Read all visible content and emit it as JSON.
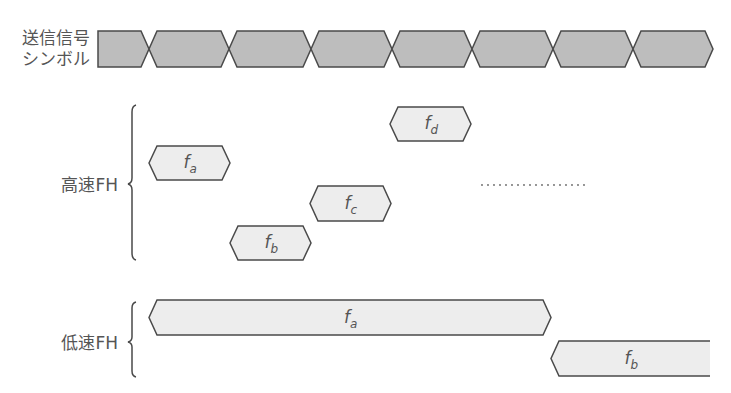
{
  "labels": {
    "tx_symbol_line1": "送信信号",
    "tx_symbol_line2": "シンボル",
    "fast_fh": "高速FH",
    "slow_fh": "低速FH"
  },
  "colors": {
    "symbol_fill": "#bdbdbd",
    "hop_fill": "#ededed",
    "stroke": "#4a4a4a",
    "text": "#555555"
  },
  "symbols": {
    "count": 8,
    "x_start": 98,
    "period": 81,
    "y_top": 31,
    "y_bottom": 67
  },
  "fast_fh_hops": [
    {
      "freq": "f",
      "sub": "a",
      "x1": 149,
      "x2": 230,
      "y1": 146,
      "y2": 180
    },
    {
      "freq": "f",
      "sub": "b",
      "x1": 230,
      "x2": 311,
      "y1": 226,
      "y2": 260
    },
    {
      "freq": "f",
      "sub": "c",
      "x1": 310,
      "x2": 391,
      "y1": 186,
      "y2": 221
    },
    {
      "freq": "f",
      "sub": "d",
      "x1": 390,
      "x2": 471,
      "y1": 107,
      "y2": 141
    }
  ],
  "slow_fh_hops": [
    {
      "freq": "f",
      "sub": "a",
      "x1": 149,
      "x2": 551,
      "y1": 300,
      "y2": 335
    },
    {
      "freq": "f",
      "sub": "b",
      "x1": 551,
      "x2": 710,
      "y1": 341,
      "y2": 376
    }
  ],
  "ellipsis": {
    "x1": 482,
    "x2": 589,
    "y": 185
  }
}
